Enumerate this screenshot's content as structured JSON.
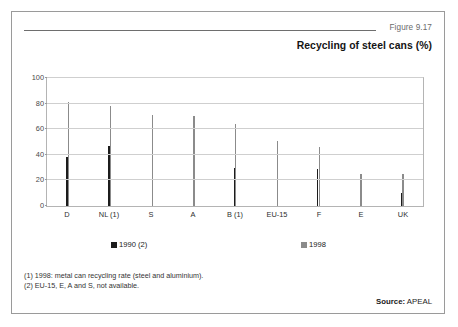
{
  "figure": {
    "number": "Figure 9.17",
    "title": "Recycling of steel cans (%)",
    "source_label": "Source:",
    "source_value": "APEAL",
    "notes": [
      "(1) 1998: metal can recycling rate (steel and aluminium).",
      "(2) EU-15, E, A and S, not available."
    ]
  },
  "colors": {
    "series_1990": "#1c1c1c",
    "series_1998": "#8b8b8b",
    "gridline": "#cfcfcf",
    "frame": "#9a9a9a"
  },
  "chart_data": {
    "type": "bar",
    "title": "Recycling of steel cans (%)",
    "xlabel": "",
    "ylabel": "",
    "ylim": [
      0,
      100
    ],
    "yticks": [
      0,
      20,
      40,
      60,
      80,
      100
    ],
    "grid": true,
    "legend_position": "bottom",
    "categories": [
      "D",
      "NL (1)",
      "S",
      "A",
      "B (1)",
      "EU-15",
      "F",
      "E",
      "UK"
    ],
    "series": [
      {
        "name": "1990 (2)",
        "color": "#1c1c1c",
        "values": [
          38,
          47,
          null,
          null,
          30,
          null,
          29,
          null,
          10
        ]
      },
      {
        "name": "1998",
        "color": "#8b8b8b",
        "values": [
          81,
          78,
          71,
          70,
          64,
          51,
          46,
          25,
          25
        ]
      }
    ]
  }
}
